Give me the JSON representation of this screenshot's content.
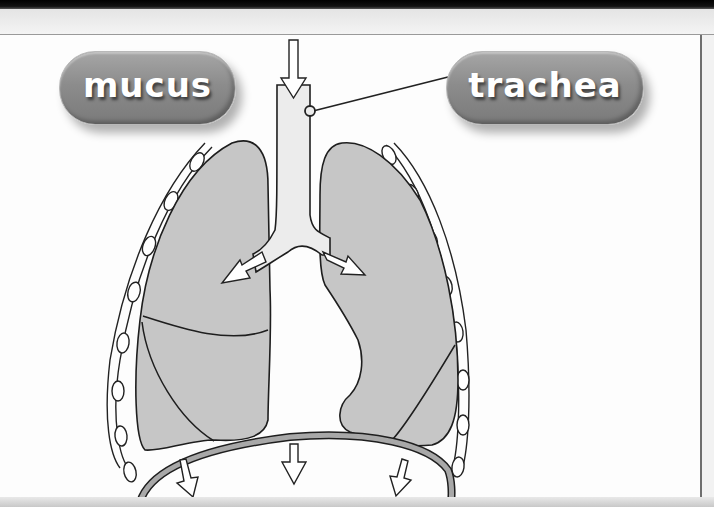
{
  "diagram": {
    "labels": {
      "mucus": "mucus",
      "trachea": "trachea"
    },
    "colors": {
      "lung_fill": "#c4c4c4",
      "trachea_fill": "#ececec",
      "outline": "#1e1e1e",
      "pill_fill": "#8c8c8c",
      "pill_text": "#ffffff",
      "diaphragm_fill": "#a8a8a8"
    },
    "arrows": {
      "inhale_down": "air entering trachea",
      "bronchi": [
        "left bronchus airflow",
        "right bronchus airflow"
      ],
      "diaphragm": [
        "left downward",
        "center downward",
        "right downward"
      ]
    }
  }
}
